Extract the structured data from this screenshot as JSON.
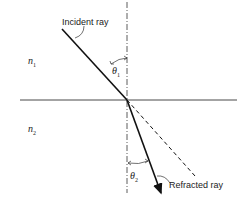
{
  "diagram": {
    "labels": {
      "incident": "Incident ray",
      "refracted": "Refracted ray",
      "n1": "n",
      "n1_sub": "1",
      "n2": "n",
      "n2_sub": "2",
      "theta1": "θ",
      "theta1_sub": "1",
      "theta2": "θ",
      "theta2_sub": "2"
    },
    "colors": {
      "line": "#111111",
      "text": "#222222",
      "background": "#ffffff"
    }
  }
}
